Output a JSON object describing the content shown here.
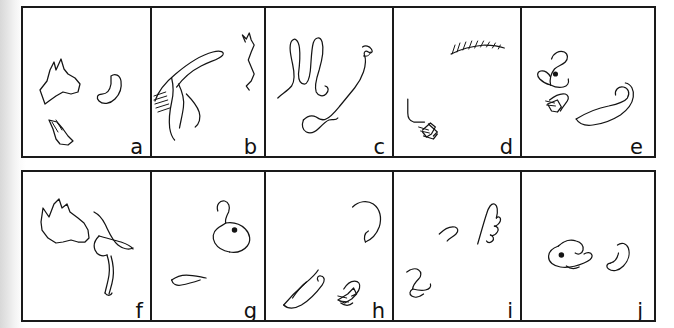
{
  "figure": {
    "background_color": "#ffffff",
    "border_color": "#1a1a1a",
    "stroke_color": "#141414",
    "rows": 2,
    "columns": 5,
    "panel_count": 10
  },
  "panels": [
    {
      "label": "a",
      "row": 1,
      "column": 1,
      "name": "panel-a",
      "strokes": 3,
      "description": "dog head outline with pointed ears, curved hook shape, small leg mark"
    },
    {
      "label": "b",
      "row": 1,
      "column": 2,
      "name": "panel-b",
      "strokes": 2,
      "description": "hatched shaded haunch with trailing legs, small head and neck squiggle"
    },
    {
      "label": "c",
      "row": 1,
      "column": 3,
      "name": "panel-c",
      "strokes": 2,
      "description": "two upright ear loops, elongated diagonal hind leg"
    },
    {
      "label": "d",
      "row": 1,
      "column": 4,
      "name": "panel-d",
      "strokes": 3,
      "description": "serrated zigzag arc, angular L mark, small arrow tuft"
    },
    {
      "label": "e",
      "row": 1,
      "column": 5,
      "name": "panel-e",
      "strokes": 3,
      "description": "mouse head with eye dot, small foot tuft, long curving tail"
    },
    {
      "label": "f",
      "row": 2,
      "column": 1,
      "name": "panel-f",
      "strokes": 2,
      "description": "dog head with ears and muzzle, curved body with hind leg"
    },
    {
      "label": "g",
      "row": 2,
      "column": 2,
      "name": "panel-g",
      "strokes": 2,
      "description": "rodent head outline with eye dot, short ground stroke"
    },
    {
      "label": "h",
      "row": 2,
      "column": 3,
      "name": "panel-h",
      "strokes": 3,
      "description": "hooked neck curve, long pointed leg, small arrow tuft"
    },
    {
      "label": "i",
      "row": 2,
      "column": 4,
      "name": "panel-i",
      "strokes": 3,
      "description": "peaked ear shape, small arc, angular hook mark"
    },
    {
      "label": "j",
      "row": 2,
      "column": 5,
      "name": "panel-j",
      "strokes": 2,
      "description": "small blob head with eye dot, curved crescent shape"
    }
  ]
}
